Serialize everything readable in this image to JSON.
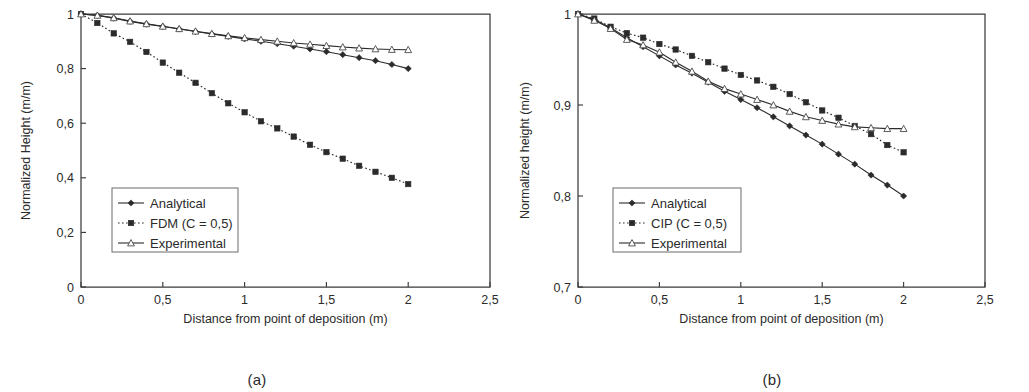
{
  "figure": {
    "panels": [
      {
        "id": "a",
        "caption": "(a)",
        "chart_data": {
          "type": "line",
          "title": "",
          "xlabel": "Distance from point of deposition (m)",
          "ylabel": "Normalized Height (m/m)",
          "xlim": [
            0,
            2.5
          ],
          "ylim": [
            0,
            1
          ],
          "xticks": [
            0,
            0.5,
            1,
            1.5,
            2,
            2.5
          ],
          "xticklabels": [
            "0",
            "0,5",
            "1",
            "1,5",
            "2",
            "2,5"
          ],
          "yticks": [
            0,
            0.2,
            0.4,
            0.6,
            0.8,
            1
          ],
          "yticklabels": [
            "0",
            "0,2",
            "0,4",
            "0,6",
            "0,8",
            "1"
          ],
          "grid": false,
          "legend_position": "lower left",
          "x": [
            0,
            0.1,
            0.2,
            0.3,
            0.4,
            0.5,
            0.6,
            0.7,
            0.8,
            0.9,
            1.0,
            1.1,
            1.2,
            1.3,
            1.4,
            1.5,
            1.6,
            1.7,
            1.8,
            1.9,
            2.0
          ],
          "series": [
            {
              "name": "Analytical",
              "marker": "filled-diamond",
              "linestyle": "solid",
              "values": [
                1.0,
                0.995,
                0.985,
                0.973,
                0.963,
                0.954,
                0.945,
                0.936,
                0.927,
                0.918,
                0.909,
                0.9,
                0.891,
                0.882,
                0.872,
                0.862,
                0.851,
                0.84,
                0.829,
                0.815,
                0.8
              ]
            },
            {
              "name": "FDM (C = 0,5)",
              "marker": "filled-square",
              "linestyle": "dotted",
              "values": [
                1.0,
                0.967,
                0.929,
                0.898,
                0.861,
                0.822,
                0.785,
                0.748,
                0.71,
                0.673,
                0.64,
                0.607,
                0.581,
                0.551,
                0.521,
                0.494,
                0.47,
                0.444,
                0.422,
                0.4,
                0.377
              ]
            },
            {
              "name": "Experimental",
              "marker": "open-triangle",
              "linestyle": "solid",
              "values": [
                1.0,
                0.995,
                0.986,
                0.974,
                0.964,
                0.955,
                0.946,
                0.937,
                0.928,
                0.92,
                0.913,
                0.906,
                0.9,
                0.894,
                0.889,
                0.884,
                0.879,
                0.875,
                0.872,
                0.87,
                0.869
              ]
            }
          ]
        }
      },
      {
        "id": "b",
        "caption": "(b)",
        "chart_data": {
          "type": "line",
          "title": "",
          "xlabel": "Distance from point of deposition (m)",
          "ylabel": "Normalized height (m/m)",
          "xlim": [
            0,
            2.5
          ],
          "ylim": [
            0.7,
            1
          ],
          "xticks": [
            0,
            0.5,
            1,
            1.5,
            2,
            2.5
          ],
          "xticklabels": [
            "0",
            "0,5",
            "1",
            "1,5",
            "2",
            "2,5"
          ],
          "yticks": [
            0.7,
            0.8,
            0.9,
            1
          ],
          "yticklabels": [
            "0,7",
            "0,8",
            "0,9",
            "1"
          ],
          "grid": false,
          "legend_position": "lower left",
          "x": [
            0,
            0.1,
            0.2,
            0.3,
            0.4,
            0.5,
            0.6,
            0.7,
            0.8,
            0.9,
            1.0,
            1.1,
            1.2,
            1.3,
            1.4,
            1.5,
            1.6,
            1.7,
            1.8,
            1.9,
            2.0
          ],
          "series": [
            {
              "name": "Analytical",
              "marker": "filled-diamond",
              "linestyle": "solid",
              "values": [
                1.0,
                0.994,
                0.985,
                0.974,
                0.964,
                0.954,
                0.944,
                0.935,
                0.925,
                0.915,
                0.906,
                0.897,
                0.887,
                0.877,
                0.867,
                0.857,
                0.846,
                0.835,
                0.823,
                0.812,
                0.8
              ]
            },
            {
              "name": "CIP (C = 0,5)",
              "marker": "filled-square",
              "linestyle": "dotted",
              "values": [
                1.0,
                0.995,
                0.986,
                0.979,
                0.974,
                0.967,
                0.961,
                0.954,
                0.947,
                0.94,
                0.933,
                0.927,
                0.92,
                0.912,
                0.903,
                0.894,
                0.886,
                0.877,
                0.868,
                0.856,
                0.848
              ]
            },
            {
              "name": "Experimental",
              "marker": "open-triangle",
              "linestyle": "solid",
              "values": [
                1.0,
                0.993,
                0.984,
                0.972,
                0.966,
                0.958,
                0.947,
                0.937,
                0.926,
                0.918,
                0.912,
                0.906,
                0.9,
                0.893,
                0.887,
                0.883,
                0.879,
                0.876,
                0.875,
                0.874,
                0.874
              ]
            }
          ]
        }
      }
    ]
  }
}
